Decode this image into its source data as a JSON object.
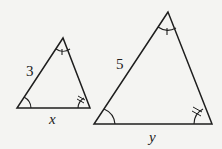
{
  "diagram": {
    "colors": {
      "stroke": "#1e1e1e",
      "background": "#f4f4f2"
    },
    "small_triangle": {
      "side_label": "3",
      "base_label": "x",
      "angle_marks": {
        "apex": "single arc with tick",
        "bottom_left": "single arc",
        "bottom_right": "arc with double tick"
      }
    },
    "large_triangle": {
      "side_label": "5",
      "base_label": "y",
      "angle_marks": {
        "apex": "single arc with tick",
        "bottom_left": "single arc",
        "bottom_right": "arc with double tick"
      }
    }
  }
}
